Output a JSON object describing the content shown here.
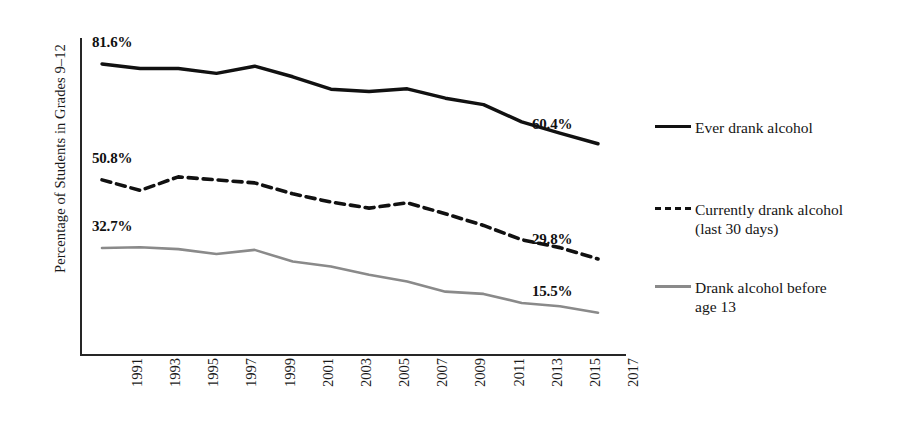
{
  "axes": {
    "ylabel": "Percentage of Students in Grades 9–12",
    "xlabel": ""
  },
  "legend": {
    "items": [
      {
        "label": "Ever drank alcohol",
        "style": "solid",
        "color": "#111111"
      },
      {
        "label": "Currently drank alcohol\n(last 30 days)",
        "style": "dashed",
        "color": "#111111"
      },
      {
        "label": "Drank alcohol before\nage 13",
        "style": "gray-solid",
        "color": "#8a8a8a"
      }
    ]
  },
  "annotations": {
    "ever_start": "81.6%",
    "ever_end": "60.4%",
    "current_start": "50.8%",
    "current_end": "29.8%",
    "before13_start": "32.7%",
    "before13_end": "15.5%"
  },
  "ticks": {
    "x": [
      "1991",
      "1993",
      "1995",
      "1997",
      "1999",
      "2001",
      "2003",
      "2005",
      "2007",
      "2009",
      "2011",
      "2013",
      "2015",
      "2017"
    ]
  },
  "chart_data": {
    "type": "line",
    "title": "",
    "xlabel": "",
    "ylabel": "Percentage of Students in Grades 9–12",
    "x": [
      1991,
      1993,
      1995,
      1997,
      1999,
      2001,
      2003,
      2005,
      2007,
      2009,
      2011,
      2013,
      2015,
      2017
    ],
    "categories": [
      "1991",
      "1993",
      "1995",
      "1997",
      "1999",
      "2001",
      "2003",
      "2005",
      "2007",
      "2009",
      "2011",
      "2013",
      "2015",
      "2017"
    ],
    "ylim": [
      0,
      100
    ],
    "xlim": [
      1991,
      2017
    ],
    "grid": false,
    "legend_position": "right",
    "series": [
      {
        "name": "Ever drank alcohol",
        "style": "solid",
        "color": "#111111",
        "values": [
          81.6,
          80.4,
          80.4,
          79.1,
          81.0,
          78.2,
          74.9,
          74.3,
          75.0,
          72.5,
          70.8,
          66.2,
          63.2,
          60.4
        ],
        "start_label": "81.6%",
        "end_label": "60.4%"
      },
      {
        "name": "Currently drank alcohol (last 30 days)",
        "style": "dashed",
        "color": "#111111",
        "values": [
          50.8,
          48.0,
          51.6,
          50.8,
          50.0,
          47.1,
          44.9,
          43.3,
          44.7,
          41.8,
          38.7,
          34.9,
          32.8,
          29.8
        ],
        "start_label": "50.8%",
        "end_label": "29.8%"
      },
      {
        "name": "Drank alcohol before age 13",
        "style": "solid",
        "color": "#8a8a8a",
        "values": [
          32.7,
          32.9,
          32.4,
          31.1,
          32.2,
          29.1,
          27.8,
          25.6,
          23.8,
          21.1,
          20.5,
          18.1,
          17.2,
          15.5
        ],
        "start_label": "32.7%",
        "end_label": "15.5%"
      }
    ]
  }
}
